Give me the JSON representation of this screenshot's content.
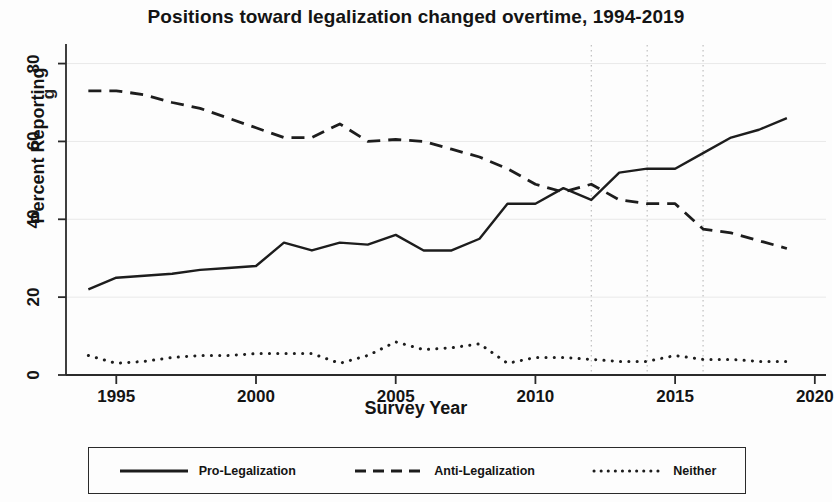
{
  "chart_data": {
    "type": "line",
    "title": "Positions toward legalization changed overtime, 1994-2019",
    "xlabel": "Survey Year",
    "ylabel": "Percent Reporting",
    "xlim": [
      1993.2,
      2020.4
    ],
    "ylim": [
      0,
      84
    ],
    "xticks": [
      1995,
      2000,
      2005,
      2010,
      2015,
      2020
    ],
    "xticklabels": [
      "1995",
      "2000",
      "2005",
      "2010",
      "2015",
      "2020"
    ],
    "yticks": [
      0,
      20,
      40,
      60,
      80
    ],
    "yticklabels": [
      "0",
      "20",
      "40",
      "60",
      "80"
    ],
    "grid": "horizontal-faint-plus-vertical-dotted",
    "vertical_reference_lines": [
      2012,
      2014,
      2016
    ],
    "legend_position": "below-plot",
    "x": [
      1994,
      1995,
      1996,
      1997,
      1998,
      1999,
      2000,
      2001,
      2002,
      2003,
      2004,
      2005,
      2006,
      2007,
      2008,
      2009,
      2010,
      2011,
      2012,
      2013,
      2014,
      2015,
      2016,
      2017,
      2018,
      2019
    ],
    "series": [
      {
        "name": "Pro-Legalization",
        "style": "solid",
        "values": [
          22,
          25,
          25.5,
          26,
          27,
          27.5,
          28,
          34,
          32,
          34,
          33.5,
          36,
          32,
          32,
          35,
          44,
          44,
          48,
          45,
          52,
          53,
          53,
          57,
          61,
          63,
          66
        ]
      },
      {
        "name": "Anti-Legalization",
        "style": "dashed",
        "values": [
          73,
          73,
          72,
          70,
          68.5,
          66,
          63.5,
          61,
          61,
          64.5,
          60,
          60.5,
          60,
          58,
          56,
          53,
          49,
          47,
          49,
          45,
          44,
          44,
          37.5,
          36.5,
          34.5,
          32.5
        ]
      },
      {
        "name": "Neither",
        "style": "dotted",
        "values": [
          5,
          3,
          3.5,
          4.5,
          5,
          5,
          5.5,
          5.5,
          5.5,
          3,
          5,
          8.5,
          6.5,
          7,
          8,
          3,
          4.5,
          4.5,
          4,
          3.5,
          3.5,
          5,
          4,
          4,
          3.5,
          3.5
        ]
      }
    ]
  },
  "legend": {
    "items": [
      {
        "label": "Pro-Legalization",
        "key": "solid-line-key"
      },
      {
        "label": "Anti-Legalization",
        "key": "dashed-line-key"
      },
      {
        "label": "Neither",
        "key": "dotted-line-key"
      }
    ]
  },
  "artifacts": {
    "stray_glyph": "g"
  }
}
